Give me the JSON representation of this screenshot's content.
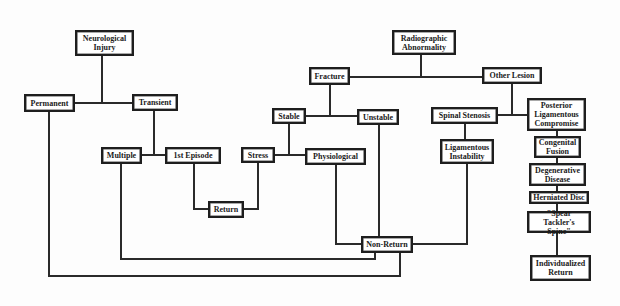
{
  "diagram": {
    "type": "flowchart",
    "colors": {
      "line": "#2a2a2a",
      "box_border": "#1e1e1e",
      "text": "#1a1a1a",
      "background": "#fdfdfd"
    },
    "nodes": {
      "neurological_injury": "Neurological\nInjury",
      "permanent": "Permanent",
      "transient": "Transient",
      "multiple": "Multiple",
      "first_episode": "1st Episode",
      "return": "Return",
      "stress": "Stress",
      "physiological": "Physiological",
      "stable": "Stable",
      "unstable": "Unstable",
      "fracture": "Fracture",
      "radiographic_abnormality": "Radiographic\nAbnormality",
      "other_lesion": "Other Lesion",
      "spinal_stenosis": "Spinal Stenosis",
      "posterior_ligamentous_compromise": "Posterior\nLigamentous\nCompromise",
      "ligamentous_instability": "Ligamentous\nInstability",
      "congenital_fusion": "Congenital\nFusion",
      "degenerative_disease": "Degenerative\nDisease",
      "herniated_disc": "Herniated Disc",
      "spear_tacklers_spine": "\"Spear Tackler's\nSpine\"",
      "individualized_return": "Individualized\nReturn",
      "non_return": "Non-Return"
    },
    "edges": [
      [
        "neurological_injury",
        "permanent"
      ],
      [
        "neurological_injury",
        "transient"
      ],
      [
        "transient",
        "multiple"
      ],
      [
        "transient",
        "first_episode"
      ],
      [
        "first_episode",
        "return"
      ],
      [
        "stress",
        "return"
      ],
      [
        "radiographic_abnormality",
        "fracture"
      ],
      [
        "radiographic_abnormality",
        "other_lesion"
      ],
      [
        "fracture",
        "stable"
      ],
      [
        "fracture",
        "unstable"
      ],
      [
        "stable",
        "stress"
      ],
      [
        "stable",
        "physiological"
      ],
      [
        "other_lesion",
        "spinal_stenosis"
      ],
      [
        "other_lesion",
        "posterior_ligamentous_compromise"
      ],
      [
        "spinal_stenosis",
        "ligamentous_instability"
      ],
      [
        "posterior_ligamentous_compromise",
        "congenital_fusion"
      ],
      [
        "congenital_fusion",
        "degenerative_disease"
      ],
      [
        "degenerative_disease",
        "herniated_disc"
      ],
      [
        "herniated_disc",
        "spear_tacklers_spine"
      ],
      [
        "spear_tacklers_spine",
        "individualized_return"
      ],
      [
        "physiological",
        "non_return"
      ],
      [
        "unstable",
        "non_return"
      ],
      [
        "ligamentous_instability",
        "non_return"
      ],
      [
        "multiple",
        "non_return"
      ],
      [
        "permanent",
        "non_return"
      ]
    ]
  }
}
